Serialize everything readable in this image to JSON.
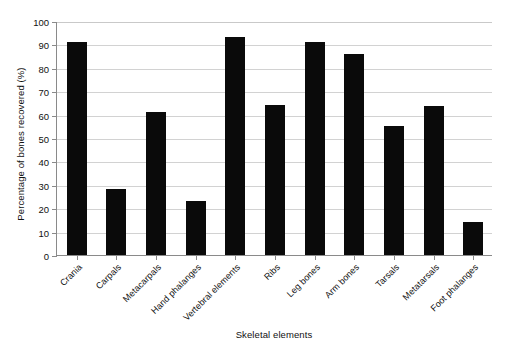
{
  "chart_data": {
    "type": "bar",
    "title": "",
    "xlabel": "Skeletal elements",
    "ylabel": "Percentage of bones recovered (%)",
    "categories": [
      "Crania",
      "Carpals",
      "Metacarpals",
      "Hand phalanges",
      "Vertebral elements",
      "Ribs",
      "Leg bones",
      "Arm bones",
      "Tarsals",
      "Metatarsals",
      "Foot phalanges"
    ],
    "values": [
      91,
      28,
      61,
      23,
      93,
      64,
      91,
      86,
      55,
      63.5,
      14
    ],
    "ylim": [
      0,
      100
    ],
    "ytick_labels": [
      "0",
      "10",
      "20",
      "30",
      "40",
      "50",
      "60",
      "70",
      "80",
      "90",
      "100"
    ],
    "ytick_values": [
      0,
      10,
      20,
      30,
      40,
      50,
      60,
      70,
      80,
      90,
      100
    ],
    "grid": "horizontal",
    "legend": "none",
    "bar_color": "#0a0a0a",
    "grid_color": "#d2d2d2",
    "axis_color": "#8a8a8a"
  }
}
